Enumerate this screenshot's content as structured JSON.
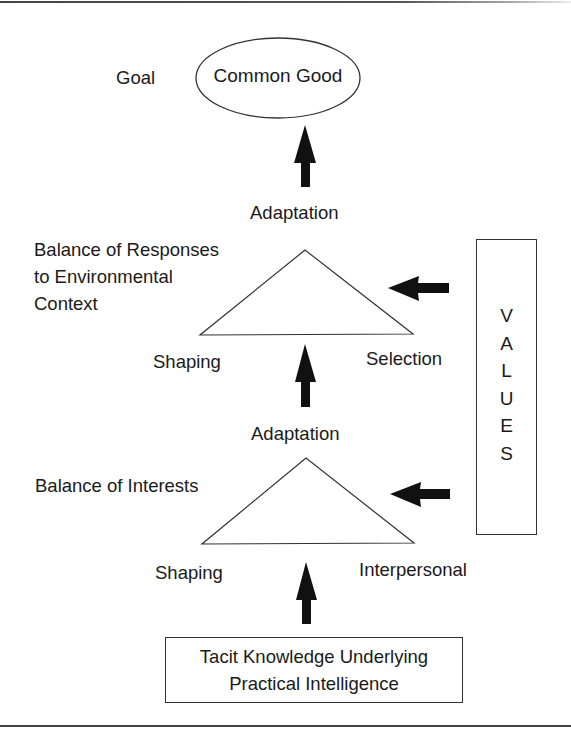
{
  "diagram": {
    "goal": {
      "label": "Goal",
      "target": "Common Good"
    },
    "upper_level": {
      "output": "Adaptation",
      "description_lines": [
        "Balance of Responses",
        "to Environmental",
        "Context"
      ],
      "left_vertex": "Shaping",
      "right_vertex": "Selection"
    },
    "lower_level": {
      "output": "Adaptation",
      "description": "Balance of Interests",
      "left_vertex": "Shaping",
      "right_vertex": "Interpersonal"
    },
    "values_box": {
      "label": "VALUES",
      "letters": [
        "V",
        "A",
        "L",
        "U",
        "E",
        "S"
      ]
    },
    "foundation": {
      "lines": [
        "Tacit Knowledge Underlying",
        "Practical Intelligence"
      ]
    },
    "colors": {
      "stroke": "#333333",
      "fill_arrow": "#111111",
      "text": "#1a1a1a",
      "background": "#ffffff"
    }
  }
}
